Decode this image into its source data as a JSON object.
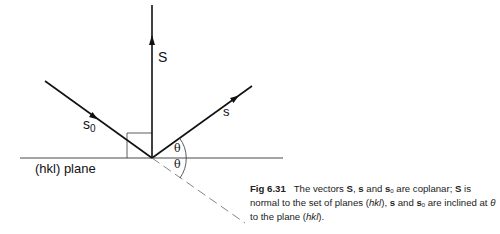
{
  "diagram": {
    "labels": {
      "S": "S",
      "s": "s",
      "s0_base": "s",
      "s0_sub": "0",
      "theta_upper": "θ",
      "theta_lower": "θ",
      "plane": "(hkl) plane"
    },
    "colors": {
      "line": "#111111",
      "thin_line": "#333333",
      "dashed": "#666666"
    }
  },
  "caption": {
    "fig_number": "Fig 6.31",
    "line1_a": "The vectors ",
    "S1": "S",
    "line1_b": ", ",
    "s1": "s",
    "line1_c": " and ",
    "s0_1": "s",
    "s0_1_sub": "0",
    "line1_d": " are coplanar; ",
    "S2": "S",
    "line2_a": " is normal to the set of planes (",
    "hkl1": "hkl",
    "line2_b": "), ",
    "s2": "s",
    "line2_c": " and ",
    "s0_2": "s",
    "s0_2_sub": "0",
    "line2_d": " are inclined at ",
    "theta": "θ",
    "line3_a": " to the plane (",
    "hkl2": "hkl",
    "line3_b": ")."
  }
}
